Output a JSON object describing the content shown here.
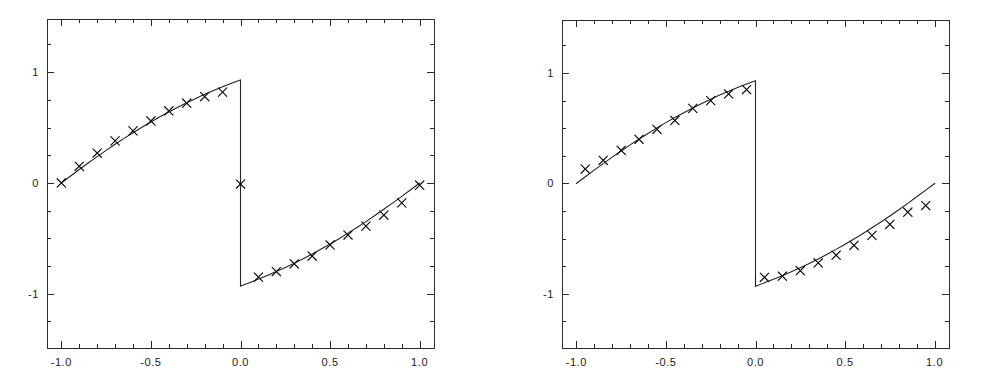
{
  "figure": {
    "background_color": "#ffffff",
    "line_color": "#222222",
    "marker_color": "#111111",
    "axis_color": "#2b2b2b",
    "panel_count": 2
  },
  "chart_data": [
    {
      "type": "line",
      "panel_name": "left-panel",
      "title": "",
      "subtitle": "",
      "xlabel": "",
      "ylabel": "",
      "xlim": [
        -1.08,
        1.08
      ],
      "ylim": [
        -1.49,
        1.48
      ],
      "grid": false,
      "legend": null,
      "xticks": [
        -1.0,
        -0.5,
        0.0,
        0.5,
        1.0
      ],
      "xticklabels": [
        "-1.0",
        "-0.5",
        "0.0",
        "0.5",
        "1.0"
      ],
      "yticks": [
        -1,
        0,
        1
      ],
      "yticklabels": [
        "-1",
        "0",
        "1"
      ],
      "x_minor_tick_step": 0.1,
      "y_minor_tick_step": 0.25,
      "series": [
        {
          "name": "exact-solution",
          "style": "line",
          "comment": "discontinuous sawtooth-like profile with jump at x=0",
          "x": [
            -1.0,
            -0.95,
            -0.9,
            -0.85,
            -0.8,
            -0.75,
            -0.7,
            -0.65,
            -0.6,
            -0.55,
            -0.5,
            -0.45,
            -0.4,
            -0.35,
            -0.3,
            -0.25,
            -0.2,
            -0.15,
            -0.1,
            -0.05,
            -0.001,
            0.001,
            0.05,
            0.1,
            0.15,
            0.2,
            0.25,
            0.3,
            0.35,
            0.4,
            0.45,
            0.5,
            0.55,
            0.6,
            0.65,
            0.7,
            0.75,
            0.8,
            0.85,
            0.9,
            0.95,
            1.0
          ],
          "y": [
            0.0,
            0.061,
            0.121,
            0.18,
            0.238,
            0.294,
            0.349,
            0.402,
            0.453,
            0.503,
            0.551,
            0.597,
            0.641,
            0.684,
            0.724,
            0.763,
            0.8,
            0.835,
            0.868,
            0.9,
            0.93,
            -0.93,
            -0.9,
            -0.868,
            -0.835,
            -0.8,
            -0.763,
            -0.724,
            -0.684,
            -0.641,
            -0.597,
            -0.551,
            -0.503,
            -0.453,
            -0.402,
            -0.349,
            -0.294,
            -0.238,
            -0.18,
            -0.121,
            -0.061,
            0.0
          ]
        },
        {
          "name": "numerical-solution",
          "style": "markers",
          "marker": "x",
          "x": [
            -1.0,
            -0.9,
            -0.8,
            -0.7,
            -0.6,
            -0.5,
            -0.4,
            -0.3,
            -0.2,
            -0.1,
            0.0,
            0.1,
            0.2,
            0.3,
            0.4,
            0.5,
            0.6,
            0.7,
            0.8,
            0.9,
            1.0
          ],
          "y": [
            0.0,
            0.15,
            0.27,
            0.38,
            0.47,
            0.56,
            0.65,
            0.72,
            0.78,
            0.82,
            -0.01,
            -0.85,
            -0.8,
            -0.73,
            -0.66,
            -0.56,
            -0.47,
            -0.39,
            -0.29,
            -0.18,
            -0.02
          ]
        }
      ]
    },
    {
      "type": "line",
      "panel_name": "right-panel",
      "title": "",
      "subtitle": "",
      "xlabel": "",
      "ylabel": "",
      "xlim": [
        -1.08,
        1.08
      ],
      "ylim": [
        -1.49,
        1.48
      ],
      "grid": false,
      "legend": null,
      "xticks": [
        -1.0,
        -0.5,
        0.0,
        0.5,
        1.0
      ],
      "xticklabels": [
        "-1.0",
        "-0.5",
        "0.0",
        "0.5",
        "1.0"
      ],
      "yticks": [
        -1,
        0,
        1
      ],
      "yticklabels": [
        "-1",
        "0",
        "1"
      ],
      "x_minor_tick_step": 0.1,
      "y_minor_tick_step": 0.25,
      "series": [
        {
          "name": "exact-solution",
          "style": "line",
          "comment": "discontinuous sawtooth-like profile with jump at x=0",
          "x": [
            -1.0,
            -0.95,
            -0.9,
            -0.85,
            -0.8,
            -0.75,
            -0.7,
            -0.65,
            -0.6,
            -0.55,
            -0.5,
            -0.45,
            -0.4,
            -0.35,
            -0.3,
            -0.25,
            -0.2,
            -0.15,
            -0.1,
            -0.05,
            -0.001,
            0.001,
            0.05,
            0.1,
            0.15,
            0.2,
            0.25,
            0.3,
            0.35,
            0.4,
            0.45,
            0.5,
            0.55,
            0.6,
            0.65,
            0.7,
            0.75,
            0.8,
            0.85,
            0.9,
            0.95,
            1.0
          ],
          "y": [
            0.0,
            0.061,
            0.121,
            0.18,
            0.238,
            0.294,
            0.349,
            0.402,
            0.453,
            0.503,
            0.551,
            0.597,
            0.641,
            0.684,
            0.724,
            0.763,
            0.8,
            0.835,
            0.868,
            0.9,
            0.93,
            -0.93,
            -0.9,
            -0.868,
            -0.835,
            -0.8,
            -0.763,
            -0.724,
            -0.684,
            -0.641,
            -0.597,
            -0.551,
            -0.503,
            -0.453,
            -0.402,
            -0.349,
            -0.294,
            -0.238,
            -0.18,
            -0.121,
            -0.061,
            0.0
          ]
        },
        {
          "name": "numerical-solution",
          "style": "markers",
          "marker": "x",
          "x": [
            -0.95,
            -0.85,
            -0.75,
            -0.65,
            -0.55,
            -0.45,
            -0.35,
            -0.25,
            -0.15,
            -0.05,
            0.05,
            0.15,
            0.25,
            0.35,
            0.45,
            0.55,
            0.65,
            0.75,
            0.85,
            0.95
          ],
          "y": [
            0.13,
            0.21,
            0.3,
            0.4,
            0.49,
            0.57,
            0.68,
            0.75,
            0.81,
            0.85,
            -0.85,
            -0.84,
            -0.79,
            -0.72,
            -0.65,
            -0.56,
            -0.47,
            -0.37,
            -0.26,
            -0.2
          ]
        }
      ]
    }
  ]
}
